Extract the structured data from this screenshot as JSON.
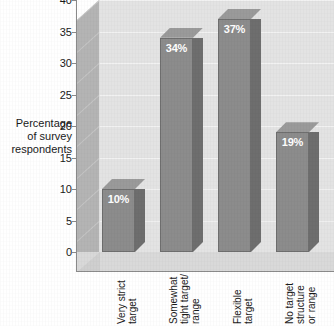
{
  "chart_data": {
    "type": "bar",
    "title": "",
    "subtitle": "",
    "xlabel": "",
    "ylabel": "Percentage of survey respondents",
    "ylabel_lines": [
      "Percentage",
      "of survey",
      "respondents"
    ],
    "categories": [
      "Very strict target",
      "Somewhat tight target/ range",
      "Flexible target",
      "No target structure or range"
    ],
    "category_lines": [
      [
        "Very strict",
        "target"
      ],
      [
        "Somewhat",
        "tight target/",
        "range"
      ],
      [
        "Flexible",
        "target"
      ],
      [
        "No target",
        "structure",
        "or range"
      ]
    ],
    "values": [
      10,
      34,
      37,
      19
    ],
    "value_labels": [
      "10%",
      "34%",
      "37%",
      "19%"
    ],
    "ylim": [
      0,
      40
    ],
    "ytick_values": [
      0,
      5,
      10,
      15,
      20,
      25,
      30,
      35,
      40
    ],
    "ytick_labels": [
      "0",
      "5",
      "10",
      "15",
      "20",
      "25",
      "30",
      "35",
      "40"
    ],
    "grid": true,
    "legend": false,
    "legend_position": "none",
    "style": "3d-column",
    "colors": {
      "bar_front": "#8c8c8c",
      "bar_side": "#6e6e6e",
      "bar_top": "#9a9a9a",
      "back_wall": "#e3e3e3",
      "floor": "#d9d9d9",
      "side_wall": "#b4b4b4",
      "axis": "#8a8a8a",
      "text": "#1a1a1a",
      "value_label": "#ffffff",
      "background": "#ffffff"
    }
  }
}
